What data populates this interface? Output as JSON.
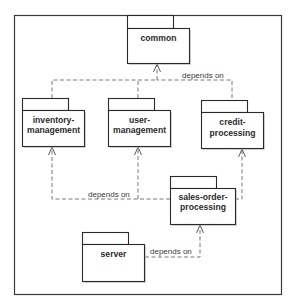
{
  "diagram": {
    "type": "UML package dependency diagram",
    "packages": [
      {
        "id": "common",
        "lines": [
          "common",
          ""
        ]
      },
      {
        "id": "inventory-management",
        "lines": [
          "inventory-",
          "management"
        ]
      },
      {
        "id": "user-management",
        "lines": [
          "user-",
          "management"
        ]
      },
      {
        "id": "credit-processing",
        "lines": [
          "credit-",
          "processing"
        ]
      },
      {
        "id": "sales-order-processing",
        "lines": [
          "sales-order-",
          "processing"
        ]
      },
      {
        "id": "server",
        "lines": [
          "server",
          ""
        ]
      }
    ],
    "dependencies": [
      {
        "from": "inventory-management",
        "to": "common",
        "label": "depends on"
      },
      {
        "from": "user-management",
        "to": "common",
        "label": "depends on"
      },
      {
        "from": "credit-processing",
        "to": "common",
        "label": "depends on"
      },
      {
        "from": "sales-order-processing",
        "to": "inventory-management",
        "label": "depends on"
      },
      {
        "from": "sales-order-processing",
        "to": "user-management",
        "label": "depends on"
      },
      {
        "from": "sales-order-processing",
        "to": "credit-processing",
        "label": ""
      },
      {
        "from": "server",
        "to": "sales-order-processing",
        "label": "depends on"
      }
    ],
    "edge_labels": {
      "top": "depends on",
      "middle": "depends on",
      "bottom": "depends on"
    }
  }
}
